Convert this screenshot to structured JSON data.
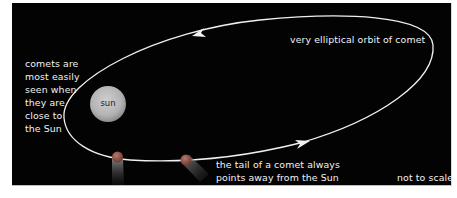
{
  "diagram": {
    "background_color": "#030303",
    "orbit": {
      "label": "very elliptical orbit of comet",
      "stroke_color": "#f0f0f0",
      "direction": "counter-clockwise (arrow at top points left, arrow at bottom points right)"
    },
    "sun": {
      "label": "sun",
      "color": "#bdbdbd"
    },
    "comets": [
      {
        "id": "comet-1",
        "tail_direction": "down, away from Sun",
        "head_color": "#9b5a4e"
      },
      {
        "id": "comet-2",
        "tail_direction": "down-right, away from Sun",
        "head_color": "#9b5a4e"
      }
    ],
    "annotations": {
      "visibility_note": [
        "comets are",
        "most easily",
        "seen when",
        "they are",
        "close to",
        "the Sun"
      ],
      "tail_note": [
        "the tail of a comet always",
        "points away from the Sun"
      ],
      "scale_note": "not to scale"
    }
  }
}
